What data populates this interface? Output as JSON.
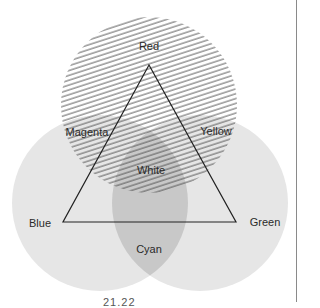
{
  "diagram": {
    "type": "additive-color-venn",
    "circles": [
      {
        "name": "Red",
        "cx": 149,
        "cy": 105,
        "r": 88,
        "fill": "hatched",
        "hatch_color": "#555555"
      },
      {
        "name": "Blue",
        "cx": 100,
        "cy": 203,
        "r": 88,
        "fill": "#e4e4e4"
      },
      {
        "name": "Green",
        "cx": 200,
        "cy": 203,
        "r": 88,
        "fill": "#e4e4e4"
      }
    ],
    "overlap_fill": "#c9c9c9",
    "triangle": {
      "top": [
        149,
        65
      ],
      "left": [
        63,
        222
      ],
      "right": [
        236,
        222
      ],
      "stroke": "#222222"
    },
    "labels": {
      "red": "Red",
      "magenta": "Magenta",
      "yellow": "Yellow",
      "white": "White",
      "blue": "Blue",
      "green": "Green",
      "cyan": "Cyan"
    },
    "caption": "21.22"
  }
}
